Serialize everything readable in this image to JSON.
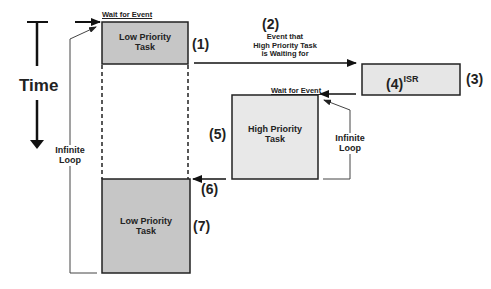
{
  "diagram": {
    "title_axis": "Time",
    "colors": {
      "low_task": "#c6c6c6",
      "high_task": "#e8e8e8",
      "isr": "#e6e6e6",
      "stroke": "#222222",
      "loop_line": "#444444"
    },
    "boxes": {
      "low1": "Low Priority Task",
      "high": "High Priority Task",
      "isr": "ISR",
      "low2": "Low Priority Task"
    },
    "labels": {
      "wait1": "Wait for Event",
      "wait2": "Wait for Event",
      "event_line1": "Event that",
      "event_line2": "High Priority Task",
      "event_line3": "is Waiting for",
      "loop_left_1": "Infinite",
      "loop_left_2": "Loop",
      "loop_right_1": "Infinite",
      "loop_right_2": "Loop"
    },
    "steps": {
      "s1": "(1)",
      "s2": "(2)",
      "s3": "(3)",
      "s4": "(4)",
      "s5": "(5)",
      "s6": "(6)",
      "s7": "(7)"
    }
  }
}
